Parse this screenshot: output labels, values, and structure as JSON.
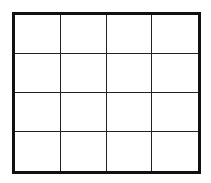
{
  "diagram": {
    "type": "grid",
    "rows": 4,
    "columns": 4,
    "line_color": "#222222",
    "border_color": "#111111",
    "background": "#ffffff",
    "cells": [
      [
        "",
        "",
        "",
        ""
      ],
      [
        "",
        "",
        "",
        ""
      ],
      [
        "",
        "",
        "",
        ""
      ],
      [
        "",
        "",
        "",
        ""
      ]
    ]
  }
}
